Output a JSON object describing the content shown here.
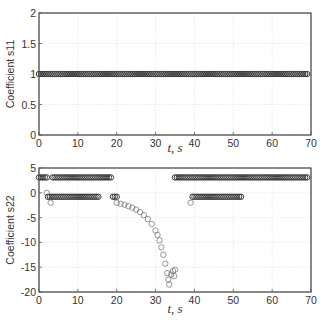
{
  "chart_data": [
    {
      "type": "scatter",
      "title": "",
      "xlabel": "t, s",
      "ylabel": "Coefficient s11",
      "xlim": [
        0,
        70
      ],
      "ylim": [
        0,
        2
      ],
      "xticks": [
        0,
        10,
        20,
        30,
        40,
        50,
        60,
        70
      ],
      "yticks": [
        0,
        0.5,
        1,
        1.5,
        2
      ],
      "ytick_labels": [
        "0",
        "0.5",
        "1",
        "1.5",
        "2"
      ],
      "grid": true,
      "marker": "open-circle",
      "series": [
        {
          "name": "s11",
          "segments": [
            {
              "t_start": 0,
              "t_end": 69,
              "value": 1
            }
          ]
        }
      ]
    },
    {
      "type": "scatter",
      "title": "",
      "xlabel": "t, s",
      "ylabel": "Coefficient s22",
      "xlim": [
        0,
        70
      ],
      "ylim": [
        -20,
        5
      ],
      "xticks": [
        0,
        10,
        20,
        30,
        40,
        50,
        60,
        70
      ],
      "yticks": [
        -20,
        -15,
        -10,
        -5,
        0,
        5
      ],
      "ytick_labels": [
        "-20",
        "-15",
        "-10",
        "-5",
        "0",
        "5"
      ],
      "grid": true,
      "marker": "open-circle",
      "series": [
        {
          "name": "s22",
          "segments": [
            {
              "t_start": 0,
              "t_end": 2,
              "value": 3.1
            },
            {
              "t_start": 3.5,
              "t_end": 18.5,
              "value": 3.1
            },
            {
              "t_start": 2.3,
              "t_end": 15.5,
              "value": -0.8
            },
            {
              "t_start": 19,
              "t_end": 20,
              "value": -0.8
            },
            {
              "t_start": 35,
              "t_end": 69,
              "value": 3.1
            },
            {
              "t_start": 39.5,
              "t_end": 52,
              "value": -0.8
            }
          ],
          "points": [
            [
              2,
              0
            ],
            [
              3,
              -2
            ],
            [
              39,
              -2
            ],
            [
              20,
              -2.0
            ],
            [
              21,
              -2.2
            ],
            [
              22,
              -2.4
            ],
            [
              23,
              -2.7
            ],
            [
              24,
              -3.0
            ],
            [
              25,
              -3.4
            ],
            [
              26,
              -3.9
            ],
            [
              27,
              -4.5
            ],
            [
              28,
              -5.3
            ],
            [
              29,
              -6.3
            ],
            [
              30,
              -7.6
            ],
            [
              30.5,
              -8.5
            ],
            [
              31,
              -9.6
            ],
            [
              31.5,
              -11
            ],
            [
              32,
              -12.5
            ],
            [
              32.5,
              -14.3
            ],
            [
              33,
              -16.2
            ],
            [
              33.3,
              -17.5
            ],
            [
              33.5,
              -18.5
            ],
            [
              34,
              -16.5
            ],
            [
              34.5,
              -15.8
            ],
            [
              35,
              -15.5
            ],
            [
              34.8,
              -16.8
            ]
          ]
        }
      ]
    }
  ],
  "labels": {
    "top_ylabel": "Coefficient s11",
    "bottom_ylabel": "Coefficient s22",
    "xlabel": "t, s"
  }
}
